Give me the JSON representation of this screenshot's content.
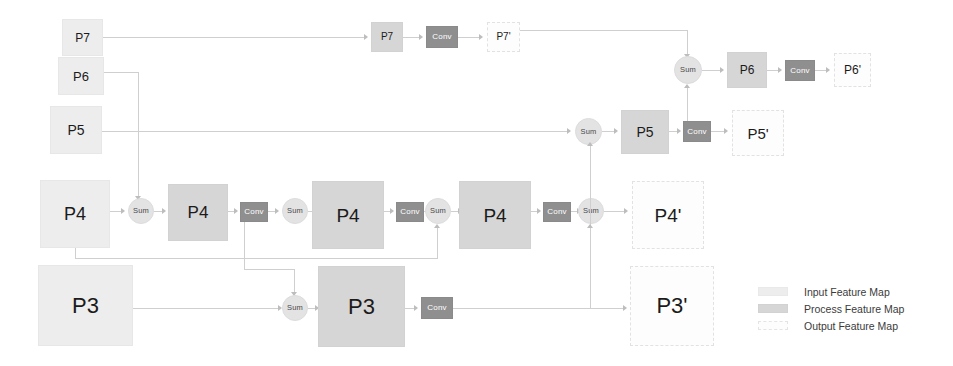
{
  "diagram": {
    "colors": {
      "input_fill": "#ededed",
      "process_fill": "#d6d6d6",
      "output_fill": "#fdfdfd",
      "conv_fill": "#8f8f8f",
      "sum_fill": "#e3e3e3",
      "line": "#cfcfcf",
      "arrow": "#bdbdbd",
      "text": "#1b1b1b"
    },
    "labels": {
      "conv": "Conv",
      "sum": "Sum"
    },
    "nodes": {
      "p7_in": "P7",
      "p7_proc": "P7",
      "p7_conv": "Conv",
      "p7_out": "P7'",
      "p6_in": "P6",
      "p6_sum": "Sum",
      "p6_proc": "P6",
      "p6_conv": "Conv",
      "p6_out": "P6'",
      "p5_in": "P5",
      "p5_sum": "Sum",
      "p5_proc": "P5",
      "p5_conv": "Conv",
      "p5_out": "P5'",
      "p4_in": "P4",
      "p4_sum1": "Sum",
      "p4_proc1": "P4",
      "p4_conv1": "Conv",
      "p4_sum2": "Sum",
      "p4_proc2": "P4",
      "p4_conv2": "Conv",
      "p4_sum3": "Sum",
      "p4_out": "P4'",
      "p3_in": "P3",
      "p3_sum": "Sum",
      "p3_proc": "P3",
      "p3_conv": "Conv",
      "p3_out": "P3'"
    }
  },
  "legend": {
    "items": [
      {
        "kind": "input",
        "label": "Input Feature Map"
      },
      {
        "kind": "process",
        "label": "Process Feature Map"
      },
      {
        "kind": "output",
        "label": "Output Feature Map"
      }
    ]
  }
}
